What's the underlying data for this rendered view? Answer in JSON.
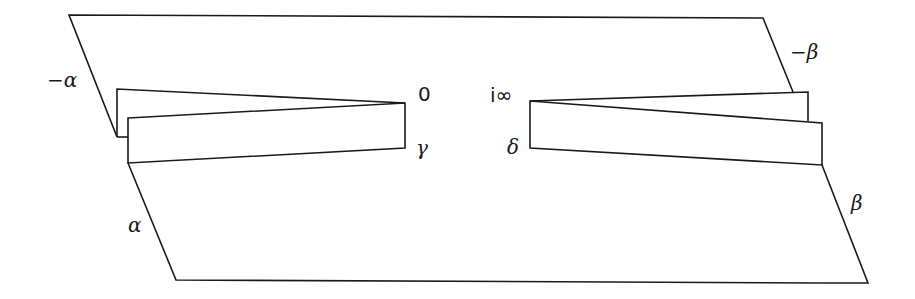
{
  "diagram": {
    "type": "fundamental domain / cut-and-glue surface diagram",
    "labels": {
      "neg_alpha": "−α",
      "alpha": "α",
      "zero": "0",
      "gamma": "γ",
      "i_infinity": "i∞",
      "delta": "δ",
      "neg_beta": "−β",
      "beta": "β"
    },
    "colors": {
      "stroke": "#1a1a1a",
      "background": "#ffffff"
    }
  }
}
